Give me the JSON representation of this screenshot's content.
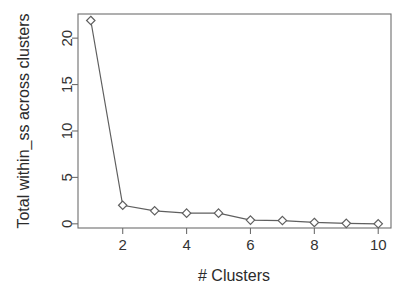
{
  "chart_data": {
    "type": "line",
    "title": "",
    "subtitle": "",
    "xlabel": "# Clusters",
    "ylabel": "Total within_ss across clusters",
    "x": [
      1,
      2,
      3,
      4,
      5,
      6,
      7,
      8,
      9,
      10
    ],
    "values": [
      21.9,
      2.0,
      1.4,
      1.15,
      1.15,
      0.4,
      0.35,
      0.15,
      0.05,
      0.0
    ],
    "series": [
      {
        "name": "Total within_ss",
        "values": [
          21.9,
          2.0,
          1.4,
          1.15,
          1.15,
          0.4,
          0.35,
          0.15,
          0.05,
          0.0
        ]
      }
    ],
    "xlim": [
      0.6,
      10.4
    ],
    "ylim": [
      -0.45,
      22.6
    ],
    "xticks": [
      2,
      4,
      6,
      8,
      10
    ],
    "xtick_labels": [
      "2",
      "4",
      "6",
      "8",
      "10"
    ],
    "yticks": [
      0,
      5,
      10,
      15,
      20
    ],
    "ytick_labels": [
      "0",
      "5",
      "10",
      "15",
      "20"
    ],
    "grid": false,
    "legend": false,
    "legend_position": "none",
    "marker": "diamond",
    "line_color": "#5f5f5f",
    "marker_fill": "#ffffff",
    "axis_color": "#6e6e6e",
    "background": "#ffffff"
  }
}
